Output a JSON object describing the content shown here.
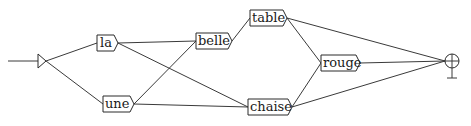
{
  "diagram": {
    "type": "finite-state-graph",
    "initial_state": {
      "id": "init",
      "x": 42,
      "y": 61
    },
    "final_state": {
      "id": "final",
      "x": 452,
      "y": 61
    },
    "nodes": [
      {
        "id": "la",
        "label": "la",
        "x": 97,
        "y": 35,
        "w": 17,
        "h": 16
      },
      {
        "id": "une",
        "label": "une",
        "x": 103,
        "y": 96,
        "w": 27,
        "h": 16
      },
      {
        "id": "belle",
        "label": "belle",
        "x": 196,
        "y": 33,
        "w": 32,
        "h": 16
      },
      {
        "id": "table",
        "label": "table",
        "x": 250,
        "y": 10,
        "w": 33,
        "h": 16
      },
      {
        "id": "chaise",
        "label": "chaise",
        "x": 248,
        "y": 99,
        "w": 40,
        "h": 16
      },
      {
        "id": "rouge",
        "label": "rouge",
        "x": 321,
        "y": 55,
        "w": 35,
        "h": 16
      }
    ],
    "edges": [
      {
        "from": "init",
        "to": "la"
      },
      {
        "from": "init",
        "to": "une"
      },
      {
        "from": "la",
        "to": "belle"
      },
      {
        "from": "la",
        "to": "chaise"
      },
      {
        "from": "une",
        "to": "belle"
      },
      {
        "from": "une",
        "to": "chaise"
      },
      {
        "from": "belle",
        "to": "table"
      },
      {
        "from": "table",
        "to": "rouge"
      },
      {
        "from": "table",
        "to": "final"
      },
      {
        "from": "chaise",
        "to": "rouge"
      },
      {
        "from": "chaise",
        "to": "final"
      },
      {
        "from": "rouge",
        "to": "final"
      }
    ],
    "colors": {
      "line": "#3a3a3a",
      "box_border": "#2a2a2a",
      "text": "#1a1a1a",
      "background": "#ffffff"
    }
  }
}
